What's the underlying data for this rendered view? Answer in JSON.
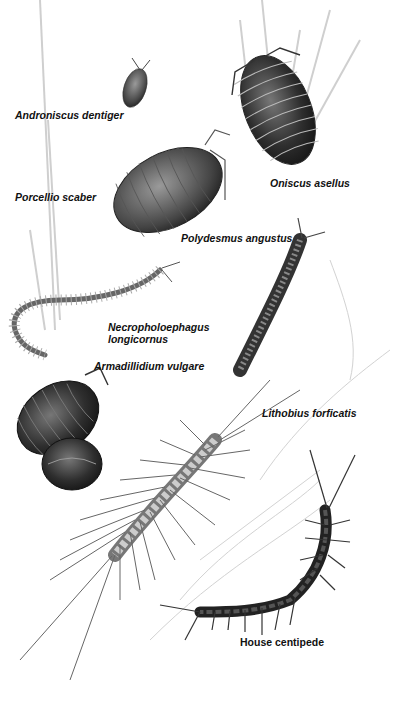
{
  "illustration": {
    "subject": "Woodlice, millipedes and centipedes",
    "labels": {
      "androniscus": "Androniscus dentiger",
      "oniscus": "Oniscus asellus",
      "porcellio": "Porcellio scaber",
      "polydesmus": "Polydesmus angustus",
      "necropholoephagus_line1": "Necropholoephagus",
      "necropholoephagus_line2": "longicornus",
      "armadillidium": "Armadillidium vulgare",
      "lithobius": "Lithobius forficatis",
      "house_centipede": "House centipede"
    }
  }
}
